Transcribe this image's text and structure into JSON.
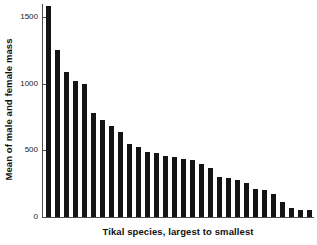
{
  "chart_data": {
    "type": "bar",
    "title": "",
    "xlabel": "Tikal species, largest to smallest",
    "ylabel": "Mean of male and female mass",
    "ylim": [
      0,
      1600
    ],
    "yticks": [
      0,
      500,
      1000,
      1500
    ],
    "ytick_labels": [
      "0",
      "500",
      "1000",
      "1500"
    ],
    "grid": false,
    "legend": null,
    "bar_color": "#141414",
    "axis_color": "#4d4d4d",
    "categories": [
      "1",
      "2",
      "3",
      "4",
      "5",
      "6",
      "7",
      "8",
      "9",
      "10",
      "11",
      "12",
      "13",
      "14",
      "15",
      "16",
      "17",
      "18",
      "19",
      "20",
      "21",
      "22",
      "23",
      "24",
      "25",
      "26",
      "27",
      "28",
      "29",
      "30"
    ],
    "values": [
      1585,
      1255,
      1090,
      1020,
      1000,
      785,
      730,
      680,
      640,
      545,
      525,
      490,
      480,
      460,
      450,
      435,
      425,
      395,
      370,
      300,
      295,
      275,
      255,
      210,
      200,
      170,
      110,
      70,
      55,
      55
    ],
    "xtick_labels": []
  }
}
